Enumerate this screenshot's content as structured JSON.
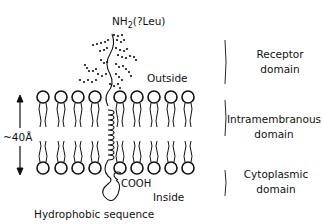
{
  "title_top": {
    "prefix": "NH",
    "sub": "2",
    "suffix": "(?Leu)"
  },
  "labels": {
    "outside": "Outside",
    "inside": "Inside",
    "cooh": "COOH",
    "thickness": "~40Å",
    "caption": "Hydrophobic sequence"
  },
  "domains": [
    {
      "line1": "Receptor",
      "line2": "domain"
    },
    {
      "line1": "Intramembranous",
      "line2": "domain"
    },
    {
      "line1": "Cytoplasmic",
      "line2": "domain"
    }
  ],
  "colors": {
    "ink": "#111111",
    "background": "#ffffff"
  }
}
